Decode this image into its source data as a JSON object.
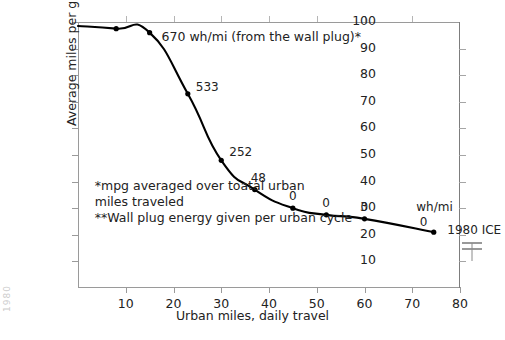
{
  "chart_data": {
    "type": "line",
    "title": "",
    "xlabel": "Urban miles, daily travel",
    "ylabel": "Average miles per gallon*",
    "xlim": [
      0,
      80
    ],
    "ylim": [
      0,
      100
    ],
    "grid": false,
    "legend": "none",
    "x_ticks": [
      10,
      20,
      30,
      40,
      50,
      60,
      70,
      80
    ],
    "y_ticks": [
      10,
      20,
      30,
      40,
      50,
      60,
      70,
      80,
      90,
      100
    ],
    "series": [
      {
        "name": "Average mpg vs urban daily miles",
        "x": [
          0,
          8,
          15,
          23,
          30,
          37,
          45,
          52,
          60,
          74.5
        ],
        "y": [
          98.5,
          97.5,
          96,
          73,
          48,
          37,
          30,
          27.5,
          26,
          21
        ],
        "point_labels": [
          "670",
          "",
          "",
          "533",
          "252",
          "48",
          "0",
          "0",
          "0",
          "0"
        ],
        "units": "wh/mi"
      }
    ],
    "annotations": [
      {
        "name": "wall-plug-annotation",
        "text": "670 wh/mi (from the wall plug)*",
        "x": 17.5,
        "y": 95
      },
      {
        "name": "wh-mi-units-label",
        "text": "wh/mi",
        "x": 70,
        "y": 30
      },
      {
        "name": "ice-reference-label",
        "text": "1980 ICE",
        "x": 78,
        "y": 22
      }
    ],
    "footnotes": [
      "*mpg averaged over toatal urban\nmiles traveled",
      "**Wall plug energy given per urban cycle"
    ],
    "reference_marker": {
      "name": "1980-ice-bracket",
      "label": "1980 ICE",
      "value": 22,
      "axis": "right"
    },
    "colors": {
      "curve": "#000000",
      "axis": "#9a9a9a",
      "text": "#222222",
      "background": "#ffffff"
    }
  },
  "edge_artifact": "1980"
}
